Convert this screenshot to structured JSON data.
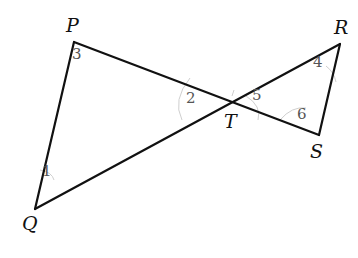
{
  "figure": {
    "vertices": [
      {
        "name": "P",
        "x": 74,
        "y": 42,
        "label_x": 66,
        "label_y": 16
      },
      {
        "name": "Q",
        "x": 35,
        "y": 209,
        "label_x": 22,
        "label_y": 214
      },
      {
        "name": "T",
        "x": 232,
        "y": 103,
        "label_x": 224,
        "label_y": 112
      },
      {
        "name": "R",
        "x": 340,
        "y": 44,
        "label_x": 334,
        "label_y": 18
      },
      {
        "name": "S",
        "x": 319,
        "y": 135,
        "label_x": 310,
        "label_y": 142
      }
    ],
    "segments": [
      [
        "P",
        "Q"
      ],
      [
        "P",
        "S"
      ],
      [
        "Q",
        "R"
      ],
      [
        "R",
        "S"
      ]
    ],
    "angles": [
      {
        "label": "1",
        "x": 42,
        "y": 164
      },
      {
        "label": "2",
        "x": 186,
        "y": 91
      },
      {
        "label": "3",
        "x": 72,
        "y": 47
      },
      {
        "label": "4",
        "x": 313,
        "y": 55
      },
      {
        "label": "5",
        "x": 252,
        "y": 88
      },
      {
        "label": "6",
        "x": 297,
        "y": 107
      }
    ],
    "stroke_color": "#111111",
    "arc_color": "#c8c8c8"
  }
}
